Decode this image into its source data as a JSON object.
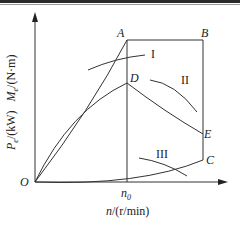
{
  "figure": {
    "type": "motor characteristic diagram",
    "y_axis": {
      "label_power_symbol": "P",
      "label_power_sub": "e",
      "label_power_unit": "/(kW)",
      "label_torque_symbol": "M",
      "label_torque_sub": "e",
      "label_torque_unit": "/(N·m)"
    },
    "x_axis": {
      "label_symbol": "n",
      "label_unit": "/(r/min)",
      "tick_label": "n",
      "tick_sub": "0"
    },
    "origin_label": "O",
    "points": {
      "A": "A",
      "B": "B",
      "C": "C",
      "D": "D",
      "E": "E"
    },
    "curves": {
      "I": "I",
      "II": "II",
      "III": "III"
    },
    "colors": {
      "line": "#333333",
      "text": "#222222",
      "background": "#ffffff"
    }
  }
}
